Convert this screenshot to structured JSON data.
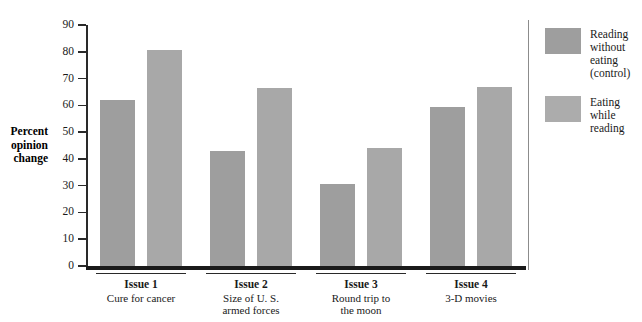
{
  "chart_data": {
    "type": "bar",
    "title": "",
    "xlabel": "",
    "ylabel": "Percent opinion change",
    "ylim": [
      0,
      90
    ],
    "ytick_labels": [
      "90",
      "80",
      "70",
      "60",
      "50",
      "40",
      "30",
      "20",
      "10",
      "0"
    ],
    "yticks": [
      90,
      80,
      70,
      60,
      50,
      40,
      30,
      20,
      10,
      0
    ],
    "grid": false,
    "legend_position": "right",
    "categories": [
      "Issue 1",
      "Issue 2",
      "Issue 3",
      "Issue 4"
    ],
    "category_sublabels": [
      "Cure for cancer",
      "Size of U. S.\narmed forces",
      "Round trip to\nthe moon",
      "3-D movies"
    ],
    "series": [
      {
        "name": "Reading without eating (control)",
        "values": [
          62,
          43,
          30.5,
          59.5
        ],
        "color": "#9e9e9e"
      },
      {
        "name": "Eating while reading",
        "values": [
          80.5,
          66.5,
          44,
          67
        ],
        "color": "#a8a8a8"
      }
    ]
  },
  "axis": {
    "y_title_lines": "Percent\nopinion\nchange"
  },
  "legend": {
    "entries": [
      {
        "label": "Reading\nwithout\neating\n(control)",
        "swatch_color": "#9e9e9e"
      },
      {
        "label": "Eating\nwhile\nreading",
        "swatch_color": "#acacac"
      }
    ]
  }
}
